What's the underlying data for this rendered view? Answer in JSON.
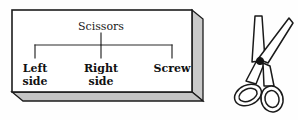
{
  "figure": {
    "background_color": "#fefefe",
    "box": {
      "fill_color": "#ffffff",
      "edge_color": "#1c1c1c",
      "shadow_color": "#c9c9c9"
    },
    "tree": {
      "root_label": "Scissors",
      "line_color": "#2a2a2a",
      "children": [
        {
          "label_line1": "Left",
          "label_line2": "side"
        },
        {
          "label_line1": "Right",
          "label_line2": "side"
        },
        {
          "label_line1": "Screw",
          "label_line2": ""
        }
      ]
    },
    "illustration": {
      "name": "scissors-illustration",
      "outline_color": "#1a1a1a",
      "pivot_color": "#151515"
    }
  }
}
